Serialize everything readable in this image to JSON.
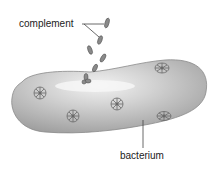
{
  "labels": {
    "complement": "complement",
    "bacterium": "bacterium"
  },
  "colors": {
    "bacterium_fill": "#bdbdbd",
    "bacterium_highlight": "#e8e8e8",
    "receptor": "#6a6a6a",
    "line": "#444444"
  }
}
